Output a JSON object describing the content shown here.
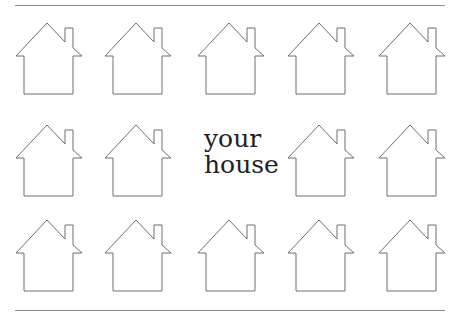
{
  "label": {
    "line1": "your",
    "line2": "house"
  },
  "grid": {
    "rows": 3,
    "columns": 5,
    "center_cell_replaced_by_label": true
  },
  "icons": {
    "house": "house-outline-icon"
  },
  "colors": {
    "outline": "#6e6e6e",
    "rule": "#8a8a8a",
    "text": "#222222",
    "background": "#ffffff"
  }
}
